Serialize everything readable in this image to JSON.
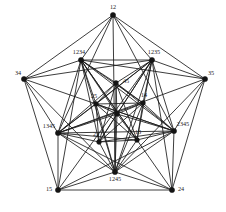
{
  "figure": {
    "background_color": "#ffffff",
    "edge_color": "#1a1a1a",
    "vertex_color": "#141414",
    "label_color": "#1a1a1a"
  },
  "nodes": [
    {
      "id": "n0",
      "label": "12",
      "x": 113.0,
      "y": 15.0,
      "r": 2.6,
      "label_dx": 0,
      "label_dy": -7,
      "anchor": "middle"
    },
    {
      "id": "n1",
      "label": "34",
      "x": 24.0,
      "y": 79.0,
      "r": 2.6,
      "label_dx": -6,
      "label_dy": -5,
      "anchor": "middle"
    },
    {
      "id": "n2",
      "label": "35",
      "x": 205.0,
      "y": 79.0,
      "r": 2.6,
      "label_dx": 6,
      "label_dy": -5,
      "anchor": "middle"
    },
    {
      "id": "n3",
      "label": "15",
      "x": 58.0,
      "y": 190.0,
      "r": 2.6,
      "label_dx": -9,
      "label_dy": 0,
      "anchor": "middle"
    },
    {
      "id": "n4",
      "label": "24",
      "x": 172.0,
      "y": 190.0,
      "r": 2.6,
      "label_dx": 9,
      "label_dy": 0,
      "anchor": "middle"
    },
    {
      "id": "n5",
      "label": "1234",
      "x": 81.0,
      "y": 60.0,
      "r": 2.6,
      "label_dx": -2,
      "label_dy": -7,
      "anchor": "middle"
    },
    {
      "id": "n6",
      "label": "1235",
      "x": 152.0,
      "y": 60.0,
      "r": 2.6,
      "label_dx": 2,
      "label_dy": -7,
      "anchor": "middle"
    },
    {
      "id": "n7",
      "label": "1345",
      "x": 58.0,
      "y": 133.0,
      "r": 2.6,
      "label_dx": -9,
      "label_dy": -6,
      "anchor": "middle"
    },
    {
      "id": "n8",
      "label": "2345",
      "x": 174.0,
      "y": 131.0,
      "r": 2.6,
      "label_dx": 9,
      "label_dy": -6,
      "anchor": "middle"
    },
    {
      "id": "n9",
      "label": "1245",
      "x": 115.0,
      "y": 172.0,
      "r": 2.6,
      "label_dx": 0,
      "label_dy": 8,
      "anchor": "middle"
    },
    {
      "id": "n10",
      "label": "45",
      "x": 116.0,
      "y": 83.0,
      "r": 2.4,
      "label_dx": 7,
      "label_dy": -1,
      "anchor": "start"
    },
    {
      "id": "n11",
      "label": "25",
      "x": 96.0,
      "y": 104.0,
      "r": 2.4,
      "label_dx": -2,
      "label_dy": -7,
      "anchor": "middle"
    },
    {
      "id": "n12",
      "label": "14",
      "x": 143.0,
      "y": 103.0,
      "r": 2.4,
      "label_dx": 1,
      "label_dy": -7,
      "anchor": "middle"
    },
    {
      "id": "n13",
      "label": "23",
      "x": 99.0,
      "y": 142.0,
      "r": 2.4,
      "label_dx": -3,
      "label_dy": -7,
      "anchor": "middle"
    },
    {
      "id": "n14",
      "label": "13",
      "x": 137.0,
      "y": 140.0,
      "r": 2.4,
      "label_dx": 1,
      "label_dy": -7,
      "anchor": "middle"
    },
    {
      "id": "n15",
      "label": "",
      "x": 117.0,
      "y": 114.0,
      "r": 2.4,
      "label_dx": 0,
      "label_dy": 0,
      "anchor": "middle"
    }
  ],
  "edges": [
    [
      "n0",
      "n1"
    ],
    [
      "n0",
      "n2"
    ],
    [
      "n1",
      "n3"
    ],
    [
      "n2",
      "n4"
    ],
    [
      "n3",
      "n4"
    ],
    [
      "n0",
      "n5"
    ],
    [
      "n0",
      "n6"
    ],
    [
      "n1",
      "n5"
    ],
    [
      "n1",
      "n7"
    ],
    [
      "n2",
      "n6"
    ],
    [
      "n2",
      "n8"
    ],
    [
      "n3",
      "n7"
    ],
    [
      "n3",
      "n9"
    ],
    [
      "n4",
      "n8"
    ],
    [
      "n4",
      "n9"
    ],
    [
      "n0",
      "n9"
    ],
    [
      "n0",
      "n7"
    ],
    [
      "n0",
      "n8"
    ],
    [
      "n1",
      "n6"
    ],
    [
      "n1",
      "n8"
    ],
    [
      "n1",
      "n9"
    ],
    [
      "n2",
      "n5"
    ],
    [
      "n2",
      "n7"
    ],
    [
      "n2",
      "n9"
    ],
    [
      "n3",
      "n5"
    ],
    [
      "n3",
      "n6"
    ],
    [
      "n3",
      "n8"
    ],
    [
      "n4",
      "n5"
    ],
    [
      "n4",
      "n6"
    ],
    [
      "n4",
      "n7"
    ],
    [
      "n5",
      "n6"
    ],
    [
      "n6",
      "n8"
    ],
    [
      "n8",
      "n9"
    ],
    [
      "n9",
      "n7"
    ],
    [
      "n7",
      "n5"
    ],
    [
      "n5",
      "n8"
    ],
    [
      "n5",
      "n9"
    ],
    [
      "n6",
      "n7"
    ],
    [
      "n6",
      "n9"
    ],
    [
      "n7",
      "n8"
    ],
    [
      "n5",
      "n10"
    ],
    [
      "n5",
      "n11"
    ],
    [
      "n5",
      "n12"
    ],
    [
      "n5",
      "n13"
    ],
    [
      "n5",
      "n14"
    ],
    [
      "n5",
      "n15"
    ],
    [
      "n6",
      "n10"
    ],
    [
      "n6",
      "n11"
    ],
    [
      "n6",
      "n12"
    ],
    [
      "n6",
      "n13"
    ],
    [
      "n6",
      "n14"
    ],
    [
      "n6",
      "n15"
    ],
    [
      "n7",
      "n10"
    ],
    [
      "n7",
      "n11"
    ],
    [
      "n7",
      "n12"
    ],
    [
      "n7",
      "n13"
    ],
    [
      "n7",
      "n14"
    ],
    [
      "n7",
      "n15"
    ],
    [
      "n8",
      "n10"
    ],
    [
      "n8",
      "n11"
    ],
    [
      "n8",
      "n12"
    ],
    [
      "n8",
      "n13"
    ],
    [
      "n8",
      "n14"
    ],
    [
      "n8",
      "n15"
    ],
    [
      "n9",
      "n10"
    ],
    [
      "n9",
      "n11"
    ],
    [
      "n9",
      "n12"
    ],
    [
      "n9",
      "n13"
    ],
    [
      "n9",
      "n14"
    ],
    [
      "n9",
      "n15"
    ],
    [
      "n10",
      "n11"
    ],
    [
      "n10",
      "n12"
    ],
    [
      "n11",
      "n13"
    ],
    [
      "n12",
      "n14"
    ],
    [
      "n13",
      "n14"
    ],
    [
      "n10",
      "n15"
    ],
    [
      "n11",
      "n15"
    ],
    [
      "n12",
      "n15"
    ],
    [
      "n13",
      "n15"
    ],
    [
      "n14",
      "n15"
    ],
    [
      "n11",
      "n12"
    ],
    [
      "n10",
      "n13"
    ],
    [
      "n10",
      "n14"
    ],
    [
      "n11",
      "n14"
    ],
    [
      "n12",
      "n13"
    ]
  ]
}
